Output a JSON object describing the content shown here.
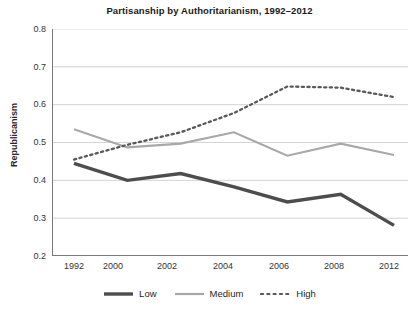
{
  "chart_data": {
    "type": "line",
    "title": "Partisanship by Authoritarianism, 1992–2012",
    "xlabel": "",
    "ylabel": "Republicanism",
    "categories": [
      "1992",
      "2000",
      "2002",
      "2004",
      "2006",
      "2008",
      "2012"
    ],
    "ylim": [
      0.2,
      0.8
    ],
    "ytick_labels": [
      "0.8",
      "0.7",
      "0.6",
      "0.5",
      "0.4",
      "0.3",
      "0.2"
    ],
    "ytick_values": [
      0.8,
      0.7,
      0.6,
      0.5,
      0.4,
      0.3,
      0.2
    ],
    "grid": "horizontal",
    "legend_position": "bottom",
    "series": [
      {
        "name": "Low",
        "style": "solid-thick",
        "color": "#4d4d4d",
        "values": [
          0.445,
          0.4,
          0.418,
          0.383,
          0.343,
          0.363,
          0.281
        ]
      },
      {
        "name": "Medium",
        "style": "solid-thin",
        "color": "#a8a8a8",
        "values": [
          0.535,
          0.487,
          0.497,
          0.527,
          0.465,
          0.497,
          0.467
        ]
      },
      {
        "name": "High",
        "style": "dotted",
        "color": "#595959",
        "values": [
          0.455,
          0.494,
          0.527,
          0.578,
          0.648,
          0.645,
          0.62
        ]
      }
    ]
  },
  "axes": {
    "grid_color": "#cfcfcf",
    "axis_color": "#7a7a7a",
    "background": "#ffffff"
  }
}
